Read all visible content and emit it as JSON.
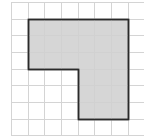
{
  "diagram": {
    "type": "grid-shape",
    "grid": {
      "origin_x": 11,
      "origin_y": 2,
      "cell_size": 16.67,
      "columns": 8,
      "rows": 8,
      "line_color": "#d4d4d4"
    },
    "shape": {
      "fill_color": "#cfcfcf",
      "stroke_color": "#2a2a2a",
      "vertices_in_cells": [
        [
          1,
          1
        ],
        [
          7,
          1
        ],
        [
          7,
          7
        ],
        [
          4,
          7
        ],
        [
          4,
          4
        ],
        [
          1,
          4
        ]
      ],
      "area_cells": 30
    }
  }
}
